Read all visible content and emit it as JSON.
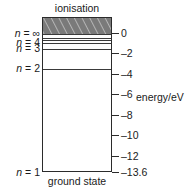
{
  "figure": {
    "title_top": "ionisation",
    "title_bottom": "ground state",
    "axis_title": "energy/eV"
  },
  "chart_data": {
    "type": "line",
    "subtitle": "ionisation",
    "xlabel": "",
    "ylabel": "energy/eV",
    "ylim": [
      -13.6,
      0
    ],
    "grid": false,
    "legend": "none",
    "y_ticks": [
      {
        "value": 0,
        "label": "0"
      },
      {
        "value": -2,
        "label": "–2"
      },
      {
        "value": -4,
        "label": "–4"
      },
      {
        "value": -6,
        "label": "–6"
      },
      {
        "value": -8,
        "label": "–8"
      },
      {
        "value": -10,
        "label": "–10"
      },
      {
        "value": -12,
        "label": "–12"
      },
      {
        "value": -13.6,
        "label": "–13.6"
      }
    ],
    "levels": [
      {
        "n": "∞",
        "label": "n = ∞",
        "energy_eV": 0,
        "labelled": true
      },
      {
        "n": "6",
        "label": "",
        "energy_eV": -0.38,
        "labelled": false
      },
      {
        "n": "5",
        "label": "",
        "energy_eV": -0.54,
        "labelled": false
      },
      {
        "n": "4",
        "label": "n = 4",
        "energy_eV": -0.85,
        "labelled": true
      },
      {
        "n": "3",
        "label": "n = 3",
        "energy_eV": -1.51,
        "labelled": true
      },
      {
        "n": "2",
        "label": "n = 2",
        "energy_eV": -3.4,
        "labelled": true
      },
      {
        "n": "1",
        "label": "n = 1",
        "energy_eV": -13.6,
        "labelled": true
      }
    ],
    "annotations": [
      {
        "text": "ionisation",
        "position": "above-box",
        "note": "hatched band above n = ∞"
      },
      {
        "text": "ground state",
        "position": "below-box",
        "note": "caption for n = 1 level"
      }
    ],
    "colors": {
      "ionisation_band": "#7a7a7a",
      "hatch": "#bdbdbd",
      "box_border": "#2b2b2b",
      "level_line": "#3a3a3a",
      "text": "#1a1a1a",
      "background": "#ffffff"
    }
  }
}
